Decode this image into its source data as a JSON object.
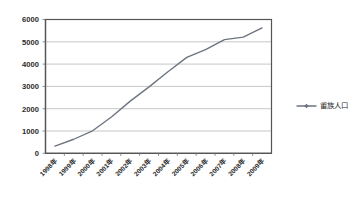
{
  "chart_data": {
    "type": "line",
    "title": "",
    "xlabel": "",
    "ylabel": "",
    "categories": [
      "1998年",
      "1999年",
      "2000年",
      "2001年",
      "2002年",
      "2003年",
      "2004年",
      "2005年",
      "2006年",
      "2007年",
      "2008年",
      "2009年"
    ],
    "series": [
      {
        "name": "畲族人口",
        "values": [
          320,
          630,
          1010,
          1630,
          2340,
          2980,
          3660,
          4300,
          4650,
          5100,
          5210,
          5620
        ]
      }
    ],
    "ylim": [
      0,
      6000
    ],
    "ytick_labels": [
      "0",
      "1000",
      "2000",
      "3000",
      "4000",
      "5000",
      "6000"
    ],
    "ytick_values": [
      0,
      1000,
      2000,
      3000,
      4000,
      5000,
      6000
    ],
    "grid": true,
    "legend_position": "right",
    "series_color": "#6c7480",
    "gridline_color": "#b9b9b9",
    "axis_color": "#555555",
    "background_color": "#ffffff",
    "text_color": "#2b2b2b"
  },
  "legend": {
    "entries": [
      {
        "label": "畲族人口",
        "marker": "diamond-marker"
      }
    ]
  }
}
